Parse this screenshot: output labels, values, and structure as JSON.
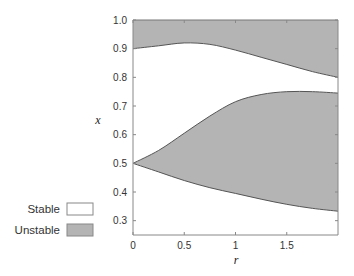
{
  "chart_data": {
    "type": "area",
    "title": "",
    "xlabel": "r",
    "ylabel": "x",
    "xlim": [
      0,
      2
    ],
    "ylim": [
      0.25,
      1.0
    ],
    "grid": false,
    "x_ticks": [
      0,
      0.5,
      1,
      1.5
    ],
    "x_tick_labels": [
      "0",
      "0.5",
      "1",
      "1.5"
    ],
    "y_ticks": [
      0.3,
      0.4,
      0.5,
      0.6,
      0.7,
      0.8,
      0.9,
      1.0
    ],
    "y_tick_labels": [
      "0.3",
      "0.4",
      "0.5",
      "0.6",
      "0.7",
      "0.8",
      "0.9",
      "1.0"
    ],
    "legend": {
      "position": "left-bottom",
      "entries": [
        {
          "label": "Stable",
          "color": "#ffffff"
        },
        {
          "label": "Unstable",
          "color": "#b4b4b4"
        }
      ]
    },
    "series": [
      {
        "name": "Unstable region (upper band)",
        "lower_boundary": {
          "x": [
            0,
            0.25,
            0.5,
            0.75,
            1.0,
            1.25,
            1.5,
            1.75,
            2.0
          ],
          "y": [
            0.9,
            0.91,
            0.92,
            0.915,
            0.895,
            0.87,
            0.845,
            0.82,
            0.8
          ]
        },
        "upper_boundary": {
          "x": [
            0,
            2.0
          ],
          "y": [
            1.0,
            1.0
          ]
        }
      },
      {
        "name": "Unstable region (middle band)",
        "upper_boundary": {
          "x": [
            0,
            0.25,
            0.5,
            0.75,
            1.0,
            1.25,
            1.5,
            1.75,
            2.0
          ],
          "y": [
            0.5,
            0.545,
            0.605,
            0.665,
            0.715,
            0.74,
            0.75,
            0.75,
            0.745
          ]
        },
        "lower_boundary": {
          "x": [
            0,
            0.25,
            0.5,
            0.75,
            1.0,
            1.25,
            1.5,
            1.75,
            2.0
          ],
          "y": [
            0.5,
            0.47,
            0.44,
            0.415,
            0.395,
            0.375,
            0.357,
            0.343,
            0.333
          ]
        }
      }
    ]
  },
  "colors": {
    "unstable_fill": "#b4b4b4",
    "boundary_line": "#555555",
    "axis": "#888888"
  }
}
